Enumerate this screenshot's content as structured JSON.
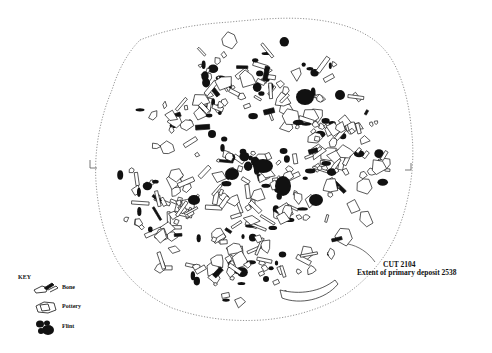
{
  "drawing": {
    "type": "archaeological plan",
    "feature_label": "CUT 2104",
    "feature_sublabel": "Extent of primary deposit 2538",
    "boundary_style": "dotted outline",
    "colors": {
      "ink": "#111111",
      "boundary": "#888888",
      "background": "#ffffff"
    }
  },
  "key": {
    "title": "KEY",
    "items": [
      {
        "label": "Bone",
        "icon": "bone-outline-icon"
      },
      {
        "label": "Pottery",
        "icon": "pottery-outline-icon"
      },
      {
        "label": "Flint",
        "icon": "flint-filled-icon"
      }
    ]
  },
  "section_marks": [
    {
      "side": "left",
      "icon": "section-mark-left"
    },
    {
      "side": "right",
      "icon": "section-mark-right"
    }
  ]
}
